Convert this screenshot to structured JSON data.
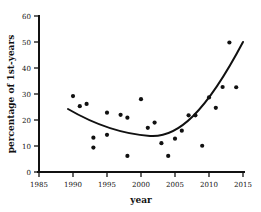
{
  "chart_data": {
    "type": "scatter",
    "title": "",
    "xlabel": "year",
    "ylabel": "percentage of 1st-years",
    "xlim": [
      1985,
      2015
    ],
    "ylim": [
      0,
      60
    ],
    "xticks": [
      1985,
      1990,
      1995,
      2000,
      2005,
      2010,
      2015
    ],
    "yticks": [
      0,
      10,
      20,
      30,
      40,
      50,
      60
    ],
    "grid": false,
    "legend": "none",
    "marker_color": "#111111",
    "curve_color": "#111111",
    "background_color": "#ffffff",
    "x": [
      1990,
      1991,
      1992,
      1993,
      1993,
      1994,
      1995,
      1996,
      1997,
      1998,
      1998,
      1999,
      2000,
      2001,
      2002,
      2003,
      2004,
      2004,
      2005,
      2006,
      2007,
      2008,
      2009,
      2010,
      2011,
      2012,
      2013,
      2014
    ],
    "values": [
      29.2,
      25.3,
      26.2,
      13.2,
      9.4,
      14.3,
      22.8,
      22.0,
      20.9,
      6.2,
      21.0,
      17.0,
      28.0,
      19.0,
      11.1,
      6.2,
      12.8,
      12.8,
      15.9,
      21.8,
      21.8,
      10.1,
      24.7,
      28.7,
      32.7,
      49.8,
      32.6,
      46.8
    ],
    "points": [
      {
        "x": 1990,
        "y": 29.2
      },
      {
        "x": 1991,
        "y": 25.3
      },
      {
        "x": 1992,
        "y": 26.2
      },
      {
        "x": 1993,
        "y": 13.2
      },
      {
        "x": 1993,
        "y": 9.4
      },
      {
        "x": 1995,
        "y": 14.3
      },
      {
        "x": 1995,
        "y": 22.8
      },
      {
        "x": 1997,
        "y": 22.0
      },
      {
        "x": 1998,
        "y": 20.9
      },
      {
        "x": 1998,
        "y": 6.2
      },
      {
        "x": 2000,
        "y": 28.0
      },
      {
        "x": 2001,
        "y": 17.0
      },
      {
        "x": 2002,
        "y": 19.0
      },
      {
        "x": 2003,
        "y": 11.1
      },
      {
        "x": 2004,
        "y": 6.2
      },
      {
        "x": 2005,
        "y": 12.8
      },
      {
        "x": 2006,
        "y": 15.9
      },
      {
        "x": 2007,
        "y": 21.8
      },
      {
        "x": 2008,
        "y": 21.8
      },
      {
        "x": 2009,
        "y": 10.1
      },
      {
        "x": 2010,
        "y": 28.7
      },
      {
        "x": 2011,
        "y": 24.7
      },
      {
        "x": 2012,
        "y": 32.7
      },
      {
        "x": 2013,
        "y": 49.8
      },
      {
        "x": 2014,
        "y": 32.6
      }
    ],
    "fit_curve": {
      "label": "fitted quadratic trend",
      "x_start": 1990,
      "x_end": 2015,
      "y_start": 24.2,
      "y_min": 13.8,
      "x_min": 2003,
      "y_end": 46.8
    }
  }
}
